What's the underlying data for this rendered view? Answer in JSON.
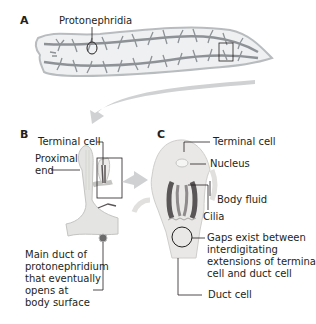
{
  "panels": {
    "a": {
      "letter": "A",
      "labels": {
        "protonephridia": "Protonephridia"
      }
    },
    "b": {
      "letter": "B",
      "labels": {
        "terminal_cell": "Terminal cell",
        "proximal_end_1": "Proximal",
        "proximal_end_2": "end",
        "main_duct": [
          "Main duct of",
          "protonephridium",
          "that eventually",
          "opens at",
          "body surface"
        ]
      }
    },
    "c": {
      "letter": "C",
      "labels": {
        "terminal_cell": "Terminal cell",
        "nucleus": "Nucleus",
        "body_fluid": "Body fluid",
        "cilia": "Cilia",
        "gaps": [
          "Gaps exist between",
          "interdigitating",
          "extensions of terminal",
          "cell and duct cell"
        ],
        "duct_cell": "Duct cell"
      }
    }
  },
  "colors": {
    "body_fill": "#eef0f1",
    "body_outline": "#b9bcbf",
    "canal": "#8e9296",
    "arrow": "#cfd1d3",
    "cell_fill": "#e4e4e2",
    "cilia_dark": "#5a5556",
    "leader": "#231f20"
  }
}
